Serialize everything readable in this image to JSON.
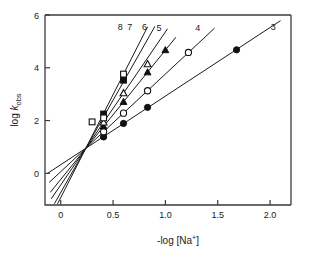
{
  "chart_data": {
    "type": "line",
    "title": "",
    "xlabel": "-log [Na+]",
    "xlabel_parts": {
      "prefix": "-log [Na",
      "superscript": "+",
      "suffix": "]"
    },
    "ylabel": "log kobs",
    "ylabel_parts": {
      "prefix": "log ",
      "italic": "k",
      "subscript": "obs"
    },
    "xlim": [
      -0.15,
      2.2
    ],
    "ylim": [
      -1.2,
      6.0
    ],
    "xticks": [
      0,
      0.5,
      1.0,
      1.5,
      2.0
    ],
    "xtick_labels": [
      "0",
      "0.5",
      "1.0",
      "1.5",
      "2.0"
    ],
    "yticks": [
      0,
      2,
      4,
      6
    ],
    "ytick_labels": [
      "0",
      "2",
      "4",
      "6"
    ],
    "grid": false,
    "legend_position": "inline-end-of-line",
    "convergence_point": {
      "x": 0.24,
      "y": 0.95
    },
    "series": [
      {
        "name": "3",
        "label": "3",
        "marker": "filled-circle",
        "slope": 2.6,
        "intercept": 0.326,
        "line_x_range": [
          -0.13,
          2.1
        ],
        "label_x": 2.03,
        "label_y": 5.42,
        "points": [
          {
            "x": 0.41,
            "y": 1.38
          },
          {
            "x": 0.6,
            "y": 1.89
          },
          {
            "x": 0.83,
            "y": 2.5
          },
          {
            "x": 1.68,
            "y": 4.68
          }
        ]
      },
      {
        "name": "4",
        "label": "4",
        "marker": "open-circle",
        "slope": 3.7,
        "intercept": 0.062,
        "line_x_range": [
          -0.11,
          1.47
        ],
        "label_x": 1.31,
        "label_y": 5.38,
        "points": [
          {
            "x": 0.41,
            "y": 1.58
          },
          {
            "x": 0.6,
            "y": 2.28
          },
          {
            "x": 0.83,
            "y": 3.13
          },
          {
            "x": 1.22,
            "y": 4.58
          }
        ]
      },
      {
        "name": "5",
        "label": "5",
        "marker": "filled-triangle",
        "slope": 4.9,
        "intercept": -0.232,
        "line_x_range": [
          -0.1,
          1.1
        ],
        "label_x": 0.94,
        "label_y": 5.4,
        "points": [
          {
            "x": 0.41,
            "y": 1.78
          },
          {
            "x": 0.6,
            "y": 2.71
          },
          {
            "x": 0.83,
            "y": 3.83
          },
          {
            "x": 1.0,
            "y": 4.67
          }
        ]
      },
      {
        "name": "6",
        "label": "6",
        "marker": "open-triangle",
        "slope": 5.8,
        "intercept": -0.442,
        "line_x_range": [
          -0.09,
          1.02
        ],
        "label_x": 0.8,
        "label_y": 5.43,
        "points": [
          {
            "x": 0.41,
            "y": 1.93
          },
          {
            "x": 0.6,
            "y": 3.04
          },
          {
            "x": 0.83,
            "y": 4.14
          }
        ]
      },
      {
        "name": "7",
        "label": "7",
        "marker": "filled-square",
        "slope": 7.0,
        "intercept": -0.73,
        "line_x_range": [
          -0.06,
          0.9
        ],
        "label_x": 0.66,
        "label_y": 5.43,
        "points": [
          {
            "x": 0.41,
            "y": 2.25
          },
          {
            "x": 0.6,
            "y": 3.53
          }
        ]
      },
      {
        "name": "8",
        "label": "8",
        "marker": "open-square",
        "slope": 7.8,
        "intercept": -0.922,
        "line_x_range": [
          -0.03,
          0.83
        ],
        "label_x": 0.57,
        "label_y": 5.45,
        "points": [
          {
            "x": 0.3,
            "y": 1.95
          },
          {
            "x": 0.41,
            "y": 2.1
          },
          {
            "x": 0.6,
            "y": 3.76
          }
        ]
      }
    ]
  }
}
